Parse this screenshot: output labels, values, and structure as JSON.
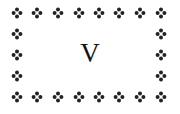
{
  "center": {
    "letter": "V"
  },
  "border": {
    "ornament_icon": "four-petal-floret-icon",
    "color": "#222222",
    "columns_x": [
      17,
      37,
      58,
      79,
      99,
      119,
      140,
      161
    ],
    "rows_y": [
      13,
      34,
      55,
      76,
      97
    ]
  }
}
